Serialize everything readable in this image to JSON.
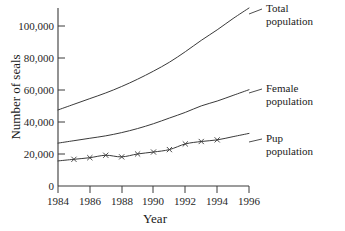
{
  "chart_data": {
    "type": "line",
    "title": "",
    "xlabel": "Year",
    "ylabel": "Number of seals",
    "xlim": [
      1984,
      1996
    ],
    "ylim": [
      0,
      110000
    ],
    "grid": false,
    "legend_position": "right-inline-labels",
    "xticks": [
      1984,
      1986,
      1988,
      1990,
      1992,
      1994,
      1996
    ],
    "xtick_labels": [
      "1984",
      "1986",
      "1988",
      "1990",
      "1992",
      "1994",
      "1996"
    ],
    "yticks": [
      0,
      20000,
      40000,
      60000,
      80000,
      100000
    ],
    "ytick_labels": [
      "0",
      "20,000",
      "40,000",
      "60,000",
      "80,000",
      "100,000"
    ],
    "x": [
      1984,
      1985,
      1986,
      1987,
      1988,
      1989,
      1990,
      1991,
      1992,
      1993,
      1994,
      1995,
      1996
    ],
    "series": [
      {
        "name": "Total population",
        "label": "Total",
        "label_line2": "population",
        "marker": "none",
        "values": [
          47000,
          50500,
          54000,
          57500,
          61500,
          66000,
          71000,
          76500,
          83000,
          90000,
          96500,
          103500,
          110000
        ]
      },
      {
        "name": "Female population",
        "label": "Female",
        "label_line2": "population",
        "marker": "none",
        "values": [
          26500,
          28000,
          29500,
          31000,
          33000,
          35500,
          38500,
          42000,
          45500,
          49500,
          52500,
          56000,
          59500
        ]
      },
      {
        "name": "Pup population",
        "label": "Pup",
        "label_line2": "population",
        "marker": "x",
        "values": [
          15500,
          16500,
          17500,
          19000,
          18000,
          19800,
          21000,
          22500,
          26000,
          27500,
          28500,
          30500,
          32500
        ]
      }
    ]
  },
  "axis": {
    "y_title": "Number of seals",
    "x_title": "Year"
  },
  "labels": {
    "total_line1": "Total",
    "total_line2": "population",
    "female_line1": "Female",
    "female_line2": "population",
    "pup_line1": "Pup",
    "pup_line2": "population"
  }
}
